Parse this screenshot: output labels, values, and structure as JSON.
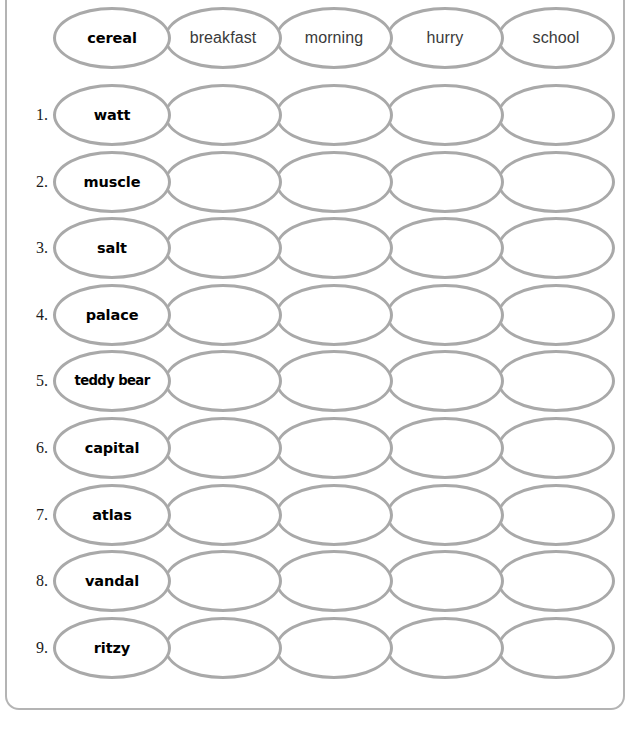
{
  "worksheet": {
    "columns": [
      "cereal",
      "breakfast",
      "morning",
      "hurry",
      "school"
    ],
    "header_row": {
      "cells": [
        {
          "label": "cereal",
          "filled": true
        },
        {
          "label": "breakfast",
          "filled": true
        },
        {
          "label": "morning",
          "filled": true
        },
        {
          "label": "hurry",
          "filled": true
        },
        {
          "label": "school",
          "filled": true
        }
      ]
    },
    "rows": [
      {
        "number": "1.",
        "word": "watt",
        "blanks": 4
      },
      {
        "number": "2.",
        "word": "muscle",
        "blanks": 4
      },
      {
        "number": "3.",
        "word": "salt",
        "blanks": 4
      },
      {
        "number": "4.",
        "word": "palace",
        "blanks": 4
      },
      {
        "number": "5.",
        "word": "teddy bear",
        "blanks": 4
      },
      {
        "number": "6.",
        "word": "capital",
        "blanks": 4
      },
      {
        "number": "7.",
        "word": "atlas",
        "blanks": 4
      },
      {
        "number": "8.",
        "word": "vandal",
        "blanks": 4
      },
      {
        "number": "9.",
        "word": "ritzy",
        "blanks": 4
      }
    ],
    "colors": {
      "oval_stroke": "#a9a9a9",
      "frame_stroke": "#b4b4b4",
      "word_text": "#000000",
      "header_text": "#3a3a3a",
      "number_text": "#1b1b1b",
      "background": "#ffffff"
    }
  }
}
